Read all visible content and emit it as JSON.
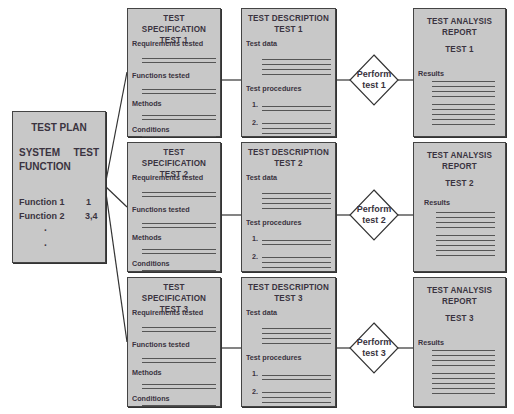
{
  "test_plan": {
    "title": "TEST PLAN",
    "col1_header_line1": "SYSTEM",
    "col1_header_line2": "FUNCTION",
    "col2_header": "TEST",
    "rows": [
      {
        "function": "Function 1",
        "test": "1"
      },
      {
        "function": "Function 2",
        "test": "3,4"
      }
    ],
    "ellipsis": [
      "·",
      "·"
    ]
  },
  "tests": [
    {
      "spec": {
        "title": "TEST SPECIFICATION",
        "test": "TEST 1",
        "fields": [
          "Requirements tested",
          "Functions tested",
          "Methods",
          "Conditions"
        ]
      },
      "desc": {
        "title": "TEST DESCRIPTION",
        "test": "TEST 1",
        "data_label": "Test data",
        "proc_label": "Test procedures",
        "steps": [
          "1.",
          "2."
        ]
      },
      "action": {
        "line1": "Perform",
        "line2": "test 1"
      },
      "report": {
        "title_line1": "TEST ANALYSIS",
        "title_line2": "REPORT",
        "test": "TEST 1",
        "results_label": "Results"
      }
    },
    {
      "spec": {
        "title": "TEST SPECIFICATION",
        "test": "TEST 2",
        "fields": [
          "Requirements tested",
          "Functions tested",
          "Methods",
          "Conditions"
        ]
      },
      "desc": {
        "title": "TEST DESCRIPTION",
        "test": "TEST 2",
        "data_label": "Test data",
        "proc_label": "Test procedures",
        "steps": [
          "1.",
          "2."
        ]
      },
      "action": {
        "line1": "Perform",
        "line2": "test 2"
      },
      "report": {
        "title_line1": "TEST ANALYSIS",
        "title_line2": "REPORT",
        "test": "TEST 2",
        "results_label": "Results"
      }
    },
    {
      "spec": {
        "title": "TEST SPECIFICATION",
        "test": "TEST 3",
        "fields": [
          "Requirements tested",
          "Functions tested",
          "Methods",
          "Conditions"
        ]
      },
      "desc": {
        "title": "TEST DESCRIPTION",
        "test": "TEST 3",
        "data_label": "Test data",
        "proc_label": "Test procedures",
        "steps": [
          "1.",
          "2."
        ]
      },
      "action": {
        "line1": "Perform",
        "line2": "test 3"
      },
      "report": {
        "title_line1": "TEST ANALYSIS",
        "title_line2": "REPORT",
        "test": "TEST 3",
        "results_label": "Results"
      }
    }
  ],
  "colors": {
    "box_fill": "#c8c8c8",
    "border": "#444444",
    "text": "#3a3340"
  }
}
